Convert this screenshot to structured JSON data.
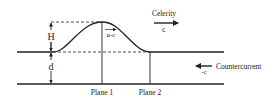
{
  "diagram": {
    "labels": {
      "height": "H",
      "depth": "d",
      "celerity": "Celerity",
      "celerity_symbol": "c",
      "relative_velocity": "u-c",
      "countercurrent": "Countercurrent",
      "countercurrent_symbol": "-c",
      "plane1": "Plane 1",
      "plane2": "Plane 2"
    },
    "colors": {
      "line": "#222222",
      "background": "#ffffff"
    }
  }
}
